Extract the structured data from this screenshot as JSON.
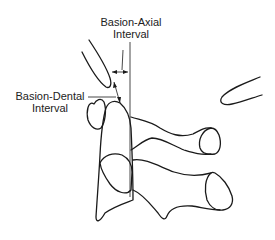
{
  "diagram": {
    "type": "anatomical line drawing",
    "labels": {
      "basion_axial": {
        "line1": "Basion-Axial",
        "line2": "Interval"
      },
      "basion_dental": {
        "line1": "Basion-Dental",
        "line2": "Interval"
      }
    },
    "colors": {
      "stroke": "#1a1a1a",
      "text": "#222222",
      "background": "#ffffff"
    }
  }
}
